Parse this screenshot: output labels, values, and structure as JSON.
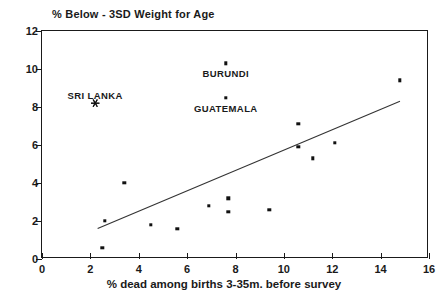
{
  "chart_data": {
    "type": "scatter",
    "title": "% Below - 3SD Weight for Age",
    "xlabel": "% dead among births 3-35m. before survey",
    "ylabel": "",
    "xlim": [
      0,
      16
    ],
    "ylim": [
      0,
      12
    ],
    "xticks": [
      0,
      2,
      4,
      6,
      8,
      10,
      12,
      14,
      16
    ],
    "yticks": [
      0,
      2,
      4,
      6,
      8,
      10,
      12
    ],
    "grid": false,
    "legend": null,
    "points": [
      {
        "x": 2.5,
        "y": 0.6,
        "label": ""
      },
      {
        "x": 2.6,
        "y": 2.0,
        "label": ""
      },
      {
        "x": 3.4,
        "y": 4.0,
        "label": ""
      },
      {
        "x": 4.5,
        "y": 1.8,
        "label": ""
      },
      {
        "x": 5.6,
        "y": 1.6,
        "label": ""
      },
      {
        "x": 6.9,
        "y": 2.8,
        "label": ""
      },
      {
        "x": 7.7,
        "y": 3.2,
        "label": ""
      },
      {
        "x": 7.7,
        "y": 2.5,
        "label": ""
      },
      {
        "x": 7.6,
        "y": 10.3,
        "label": "BURUNDI"
      },
      {
        "x": 7.6,
        "y": 8.5,
        "label": "GUATEMALA"
      },
      {
        "x": 9.4,
        "y": 2.6,
        "label": ""
      },
      {
        "x": 10.6,
        "y": 5.9,
        "label": ""
      },
      {
        "x": 10.6,
        "y": 7.1,
        "label": ""
      },
      {
        "x": 11.2,
        "y": 5.3,
        "label": ""
      },
      {
        "x": 12.1,
        "y": 6.1,
        "label": ""
      },
      {
        "x": 14.8,
        "y": 9.4,
        "label": ""
      }
    ],
    "special_points": [
      {
        "x": 2.2,
        "y": 8.2,
        "label": "SRI LANKA",
        "marker": "star"
      }
    ],
    "trendline": {
      "x0": 2.3,
      "y0": 1.6,
      "x1": 14.8,
      "y1": 8.3
    }
  },
  "annotations": {
    "sri_lanka": "SRI LANKA",
    "burundi": "BURUNDI",
    "guatemala": "GUATEMALA"
  }
}
